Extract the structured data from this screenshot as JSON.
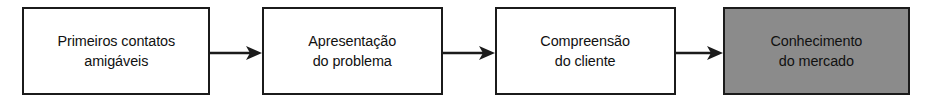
{
  "diagram": {
    "type": "horizontal-process-flow",
    "orientation": "left-to-right",
    "background_color": "#ffffff",
    "stroke_color": "#1b1b1b",
    "text_color": "#111111",
    "highlight_fill": "#8b8b8b",
    "default_fill": "#ffffff",
    "nodes": [
      {
        "id": "node-1",
        "label": "Primeiros contatos\namigáveis",
        "line1": "Primeiros contatos",
        "line2": "amigáveis",
        "fill": "#ffffff",
        "highlighted": false,
        "x": 22,
        "y": 7,
        "width": 188,
        "height": 88
      },
      {
        "id": "node-2",
        "label": "Apresentação\ndo problema",
        "line1": "Apresentação",
        "line2": "do problema",
        "fill": "#ffffff",
        "highlighted": false,
        "x": 262,
        "y": 7,
        "width": 181,
        "height": 88
      },
      {
        "id": "node-3",
        "label": "Compreensão\ndo cliente",
        "line1": "Compreensão",
        "line2": "do cliente",
        "fill": "#ffffff",
        "highlighted": false,
        "x": 495,
        "y": 7,
        "width": 181,
        "height": 88
      },
      {
        "id": "node-4",
        "label": "Conhecimento\ndo mercado",
        "line1": "Conhecimento",
        "line2": "do mercado",
        "fill": "#8b8b8b",
        "highlighted": true,
        "x": 723,
        "y": 7,
        "width": 187,
        "height": 88
      }
    ],
    "connectors": [
      {
        "id": "connector-1",
        "from": "node-1",
        "to": "node-2",
        "x": 210,
        "y": 44,
        "length": 52,
        "style": "solid-arrow"
      },
      {
        "id": "connector-2",
        "from": "node-2",
        "to": "node-3",
        "x": 443,
        "y": 44,
        "length": 52,
        "style": "solid-arrow"
      },
      {
        "id": "connector-3",
        "from": "node-3",
        "to": "node-4",
        "x": 676,
        "y": 44,
        "length": 47,
        "style": "solid-arrow"
      }
    ]
  }
}
